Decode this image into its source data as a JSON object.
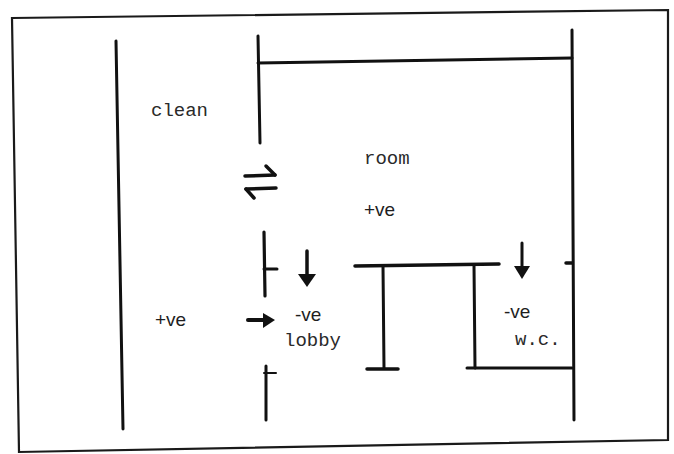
{
  "diagram": {
    "colors": {
      "ink": "#111111",
      "background": "#ffffff",
      "text": "#2a2a2a"
    },
    "labels": {
      "clean": "clean",
      "room": "room",
      "room_pressure": "+ve",
      "corridor_pressure": "+ve",
      "lobby_pressure": "-ve",
      "lobby": "lobby",
      "wc_pressure": "-ve",
      "wc": "w.c."
    },
    "zones": [
      {
        "name": "clean room",
        "pressure": "+ve"
      },
      {
        "name": "corridor",
        "pressure": "+ve"
      },
      {
        "name": "lobby",
        "pressure": "-ve"
      },
      {
        "name": "w.c.",
        "pressure": "-ve"
      }
    ],
    "airflow_arrows": [
      {
        "type": "bidirectional",
        "between": "clean room / corridor"
      },
      {
        "type": "down",
        "into": "lobby"
      },
      {
        "type": "right",
        "into": "lobby"
      },
      {
        "type": "down",
        "into": "w.c."
      }
    ]
  }
}
